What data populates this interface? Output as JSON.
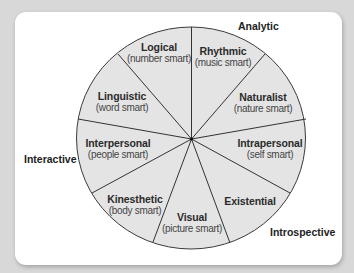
{
  "diagram": {
    "type": "wheel",
    "colors": {
      "background": "#d8d8d8",
      "card": "#ffffff",
      "sector_fill": "#e4e4e4",
      "divider": "#333333",
      "text": "#2b2b2b"
    },
    "group_labels": {
      "analytic": "Analytic",
      "interactive": "Interactive",
      "introspective": "Introspective"
    },
    "segments": [
      {
        "name": "Logical",
        "sub": "(number smart)"
      },
      {
        "name": "Rhythmic",
        "sub": "(music smart)"
      },
      {
        "name": "Naturalist",
        "sub": "(nature smart)"
      },
      {
        "name": "Intrapersonal",
        "sub": "(self smart)"
      },
      {
        "name": "Existential",
        "sub": ""
      },
      {
        "name": "Visual",
        "sub": "(picture smart)"
      },
      {
        "name": "Kinesthetic",
        "sub": "(body smart)"
      },
      {
        "name": "Interpersonal",
        "sub": "(people smart)"
      },
      {
        "name": "Linguistic",
        "sub": "(word smart)"
      }
    ]
  }
}
